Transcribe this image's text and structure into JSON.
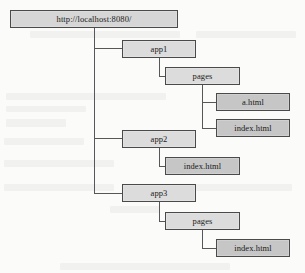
{
  "diagram": {
    "type": "tree",
    "title_text": "",
    "colors": {
      "node_fill_light": "#dcdcdc",
      "node_fill_dark": "#c6c6c6",
      "node_border": "#4a4a4a",
      "edge": "#575757",
      "background": "#fbfbfa",
      "text": "#1a1a1a"
    },
    "nodes": [
      {
        "id": "root",
        "label": "http://localhost:8080/",
        "depth": 0
      },
      {
        "id": "app1",
        "label": "app1",
        "depth": 1
      },
      {
        "id": "app1-pages",
        "label": "pages",
        "depth": 2
      },
      {
        "id": "a-html",
        "label": "a.html",
        "depth": 3
      },
      {
        "id": "app1-index",
        "label": "index.html",
        "depth": 3
      },
      {
        "id": "app2",
        "label": "app2",
        "depth": 1
      },
      {
        "id": "app2-index",
        "label": "index.html",
        "depth": 2
      },
      {
        "id": "app3",
        "label": "app3",
        "depth": 1
      },
      {
        "id": "app3-pages",
        "label": "pages",
        "depth": 2
      },
      {
        "id": "app3-index",
        "label": "index.html",
        "depth": 3
      }
    ],
    "edges": [
      {
        "from": "root",
        "to": "app1"
      },
      {
        "from": "root",
        "to": "app2"
      },
      {
        "from": "root",
        "to": "app3"
      },
      {
        "from": "app1",
        "to": "app1-pages"
      },
      {
        "from": "app1-pages",
        "to": "a-html"
      },
      {
        "from": "app1-pages",
        "to": "app1-index"
      },
      {
        "from": "app2",
        "to": "app2-index"
      },
      {
        "from": "app3",
        "to": "app3-pages"
      },
      {
        "from": "app3-pages",
        "to": "app3-index"
      }
    ]
  }
}
